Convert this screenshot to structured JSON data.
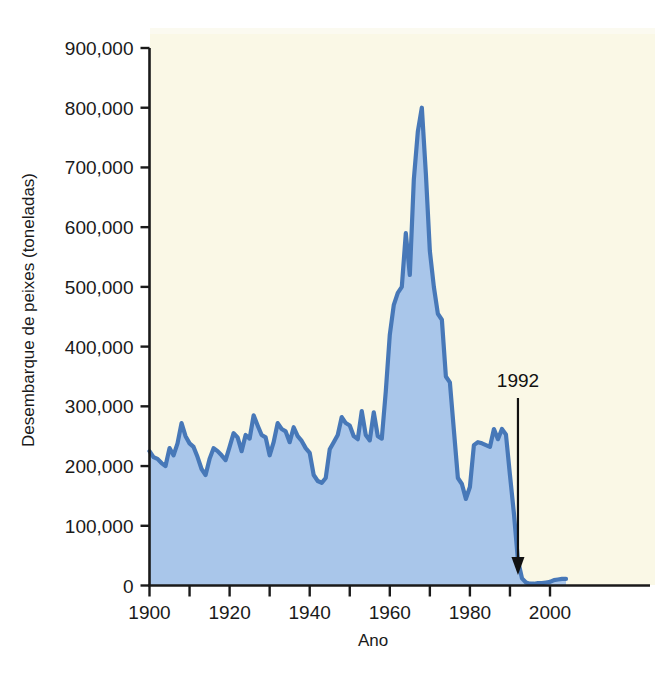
{
  "figure": {
    "background_color": "#ffffff",
    "page_background_color": "#faf8e6",
    "xlabel": "Ano",
    "ylabel": "Desembarque de peixes (toneladas)"
  },
  "annotation": {
    "label": "1992",
    "icon": "down-arrow-icon",
    "year": 1992
  },
  "ghost_text": {
    "line1": "",
    "line2": "",
    "line3": "",
    "line4": "",
    "line5": "",
    "line6": "",
    "line7": "",
    "line8": "",
    "line9": "",
    "line10": "",
    "line11": "",
    "line12": "",
    "line13": ""
  },
  "chart_data": {
    "type": "area",
    "title": "",
    "xlabel": "Ano",
    "ylabel": "Desembarque de peixes (toneladas)",
    "xlim": [
      1900,
      2005
    ],
    "ylim": [
      0,
      900000
    ],
    "grid": false,
    "legend": null,
    "line_color": "#4778b8",
    "fill_color": "#a9c6ea",
    "xticks": [
      1900,
      1910,
      1920,
      1930,
      1940,
      1950,
      1960,
      1970,
      1980,
      1990,
      2000
    ],
    "xtick_labels": [
      "1900",
      "",
      "1920",
      "",
      "1940",
      "",
      "1960",
      "",
      "1980",
      "",
      "2000"
    ],
    "yticks": [
      0,
      100000,
      200000,
      300000,
      400000,
      500000,
      600000,
      700000,
      800000,
      900000
    ],
    "ytick_labels": [
      "0",
      "100,000",
      "200,000",
      "300,000",
      "400,000",
      "500,000",
      "600,000",
      "700,000",
      "800,000",
      "900,000"
    ],
    "x": [
      1900,
      1901,
      1902,
      1903,
      1904,
      1905,
      1906,
      1907,
      1908,
      1909,
      1910,
      1911,
      1912,
      1913,
      1914,
      1915,
      1916,
      1917,
      1918,
      1919,
      1920,
      1921,
      1922,
      1923,
      1924,
      1925,
      1926,
      1927,
      1928,
      1929,
      1930,
      1931,
      1932,
      1933,
      1934,
      1935,
      1936,
      1937,
      1938,
      1939,
      1940,
      1941,
      1942,
      1943,
      1944,
      1945,
      1946,
      1947,
      1948,
      1949,
      1950,
      1951,
      1952,
      1953,
      1954,
      1955,
      1956,
      1957,
      1958,
      1959,
      1960,
      1961,
      1962,
      1963,
      1964,
      1965,
      1966,
      1967,
      1968,
      1969,
      1970,
      1971,
      1972,
      1973,
      1974,
      1975,
      1976,
      1977,
      1978,
      1979,
      1980,
      1981,
      1982,
      1983,
      1984,
      1985,
      1986,
      1987,
      1988,
      1989,
      1990,
      1991,
      1992,
      1993,
      1994,
      1995,
      1996,
      1997,
      1998,
      1999,
      2000,
      2001,
      2002,
      2003,
      2004
    ],
    "values": [
      225000,
      215000,
      212000,
      205000,
      200000,
      230000,
      218000,
      238000,
      272000,
      250000,
      238000,
      232000,
      215000,
      195000,
      185000,
      212000,
      230000,
      225000,
      218000,
      210000,
      232000,
      255000,
      248000,
      225000,
      252000,
      246000,
      285000,
      268000,
      252000,
      248000,
      218000,
      240000,
      272000,
      262000,
      258000,
      240000,
      265000,
      250000,
      242000,
      230000,
      222000,
      185000,
      175000,
      172000,
      180000,
      228000,
      240000,
      252000,
      282000,
      272000,
      268000,
      250000,
      245000,
      292000,
      252000,
      243000,
      290000,
      250000,
      246000,
      325000,
      420000,
      470000,
      490000,
      500000,
      590000,
      520000,
      680000,
      760000,
      800000,
      690000,
      560000,
      500000,
      455000,
      445000,
      350000,
      340000,
      260000,
      180000,
      170000,
      145000,
      165000,
      235000,
      240000,
      238000,
      235000,
      232000,
      262000,
      245000,
      262000,
      253000,
      185000,
      120000,
      42000,
      12000,
      5000,
      3000,
      3000,
      4000,
      4000,
      5000,
      6000,
      9000,
      10000,
      11000,
      11000
    ]
  }
}
